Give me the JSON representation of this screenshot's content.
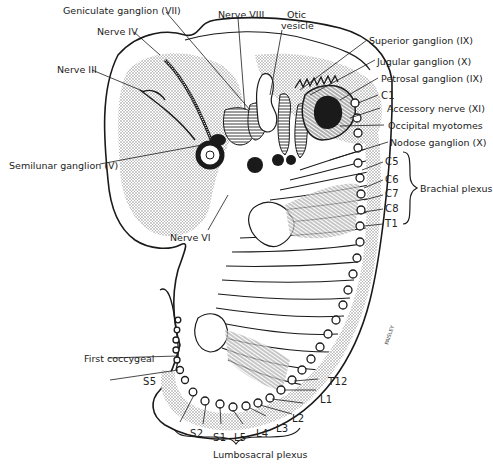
{
  "figure": {
    "type": "embryo-nervous-system-diagram",
    "colors": {
      "ink": "#1a1a1a",
      "stipple": "#9a9a9a",
      "paper": "#ffffff"
    }
  },
  "labels": {
    "cranial": {
      "geniculate": "Geniculate ganglion (VII)",
      "nerve_iv": "Nerve IV",
      "nerve_iii": "Nerve III",
      "nerve_viii": "Nerve VIII",
      "otic_1": "Otic",
      "otic_2": "vesicle",
      "superior": "Superior ganglion (IX)",
      "jugular": "Jugular ganglion (X)",
      "petrosal": "Petrosal ganglion (IX)",
      "accessory": "Accessory nerve (XI)",
      "occipital": "Occipital myotomes",
      "nodose": "Nodose ganglion (X)",
      "semilunar": "Semilunar ganglion (V)",
      "nerve_vi": "Nerve VI"
    },
    "segments": {
      "c1": "C1",
      "c5": "C5",
      "c6": "C6",
      "c7": "C7",
      "c8": "C8",
      "t1": "T1",
      "t12": "T12",
      "l1": "L1",
      "l2": "L2",
      "l3": "L3",
      "l4": "L4",
      "l5": "L5",
      "s1": "S1",
      "s2": "S2",
      "s5": "S5",
      "first_coccygeal": "First coccygeal"
    },
    "plexus": {
      "brachial": "Brachial plexus",
      "lumbosacral": "Lumbosacral plexus"
    },
    "signature": "PAISLEY"
  }
}
